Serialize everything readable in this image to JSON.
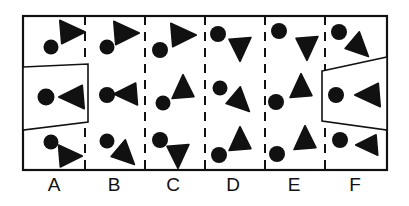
{
  "figure": {
    "title": "",
    "frame": {
      "x": 23,
      "y": 16,
      "width": 364,
      "height": 154,
      "stroke_color": "#111111",
      "stroke_width": 2.2,
      "fill_color": "#ffffff"
    },
    "dividers": {
      "style": "dashed",
      "stroke_color": "#111111",
      "stroke_width": 2.0,
      "dash_pattern": "9 7",
      "x_positions": [
        85,
        145,
        205,
        265,
        325
      ]
    },
    "columns": [
      {
        "id": "A",
        "label": "A",
        "label_x": 54,
        "label_y": 175,
        "x_start": 23,
        "x_end": 85,
        "shapes": [
          {
            "kind": "circle",
            "cx": 51,
            "cy": 47,
            "r": 7.5,
            "color": "#111111"
          },
          {
            "kind": "triangle",
            "cx": 71,
            "cy": 32,
            "size": 15,
            "rotation": 20,
            "direction": "right",
            "color": "#111111"
          },
          {
            "kind": "circle",
            "cx": 46,
            "cy": 97,
            "r": 8.5,
            "color": "#111111"
          },
          {
            "kind": "triangle",
            "cx": 73,
            "cy": 97,
            "size": 15,
            "rotation": 0,
            "direction": "left",
            "color": "#111111"
          },
          {
            "kind": "circle",
            "cx": 51,
            "cy": 142,
            "r": 7.5,
            "color": "#111111"
          },
          {
            "kind": "triangle",
            "cx": 69,
            "cy": 156,
            "size": 14,
            "rotation": 20,
            "direction": "right",
            "color": "#111111"
          }
        ]
      },
      {
        "id": "B",
        "label": "B",
        "label_x": 114,
        "label_y": 175,
        "x_start": 85,
        "x_end": 145,
        "shapes": [
          {
            "kind": "circle",
            "cx": 107,
            "cy": 47,
            "r": 7.5,
            "color": "#111111"
          },
          {
            "kind": "triangle",
            "cx": 125,
            "cy": 33,
            "size": 15,
            "rotation": 20,
            "direction": "right",
            "color": "#111111"
          },
          {
            "kind": "circle",
            "cx": 107,
            "cy": 95,
            "r": 8.0,
            "color": "#111111"
          },
          {
            "kind": "triangle",
            "cx": 127,
            "cy": 94,
            "size": 14,
            "rotation": 0,
            "direction": "left",
            "color": "#111111"
          },
          {
            "kind": "circle",
            "cx": 107,
            "cy": 141,
            "r": 7.5,
            "color": "#111111"
          },
          {
            "kind": "triangle",
            "cx": 125,
            "cy": 155,
            "size": 14,
            "rotation": 200,
            "direction": "down-right",
            "color": "#111111"
          }
        ]
      },
      {
        "id": "C",
        "label": "C",
        "label_x": 173,
        "label_y": 175,
        "x_start": 145,
        "x_end": 205,
        "shapes": [
          {
            "kind": "circle",
            "cx": 160,
            "cy": 50,
            "r": 8.0,
            "color": "#111111"
          },
          {
            "kind": "triangle",
            "cx": 182,
            "cy": 35,
            "size": 15,
            "rotation": 20,
            "direction": "right",
            "color": "#111111"
          },
          {
            "kind": "circle",
            "cx": 163,
            "cy": 103,
            "r": 7.5,
            "color": "#111111"
          },
          {
            "kind": "triangle",
            "cx": 183,
            "cy": 88,
            "size": 14,
            "rotation": 15,
            "direction": "up",
            "color": "#111111"
          },
          {
            "kind": "circle",
            "cx": 160,
            "cy": 140,
            "r": 8.0,
            "color": "#111111"
          },
          {
            "kind": "triangle",
            "cx": 178,
            "cy": 155,
            "size": 14,
            "rotation": 190,
            "direction": "down",
            "color": "#111111"
          }
        ]
      },
      {
        "id": "D",
        "label": "D",
        "label_x": 233,
        "label_y": 175,
        "x_start": 205,
        "x_end": 265,
        "shapes": [
          {
            "kind": "circle",
            "cx": 218,
            "cy": 34,
            "r": 8.0,
            "color": "#111111"
          },
          {
            "kind": "triangle",
            "cx": 240,
            "cy": 48,
            "size": 14,
            "rotation": 185,
            "direction": "down",
            "color": "#111111"
          },
          {
            "kind": "circle",
            "cx": 220,
            "cy": 88,
            "r": 7.5,
            "color": "#111111"
          },
          {
            "kind": "triangle",
            "cx": 240,
            "cy": 102,
            "size": 14,
            "rotation": 160,
            "direction": "down-right",
            "color": "#111111"
          },
          {
            "kind": "circle",
            "cx": 219,
            "cy": 155,
            "r": 8.0,
            "color": "#111111"
          },
          {
            "kind": "triangle",
            "cx": 240,
            "cy": 140,
            "size": 14,
            "rotation": 10,
            "direction": "up",
            "color": "#111111"
          }
        ]
      },
      {
        "id": "E",
        "label": "E",
        "label_x": 294,
        "label_y": 175,
        "x_start": 265,
        "x_end": 325,
        "shapes": [
          {
            "kind": "circle",
            "cx": 279,
            "cy": 31,
            "r": 8.0,
            "color": "#111111"
          },
          {
            "kind": "triangle",
            "cx": 307,
            "cy": 47,
            "size": 14,
            "rotation": 195,
            "direction": "down",
            "color": "#111111"
          },
          {
            "kind": "circle",
            "cx": 276,
            "cy": 102,
            "r": 8.0,
            "color": "#111111"
          },
          {
            "kind": "triangle",
            "cx": 301,
            "cy": 87,
            "size": 14,
            "rotation": 10,
            "direction": "up",
            "color": "#111111"
          },
          {
            "kind": "circle",
            "cx": 277,
            "cy": 154,
            "r": 8.0,
            "color": "#111111"
          },
          {
            "kind": "triangle",
            "cx": 305,
            "cy": 139,
            "size": 14,
            "rotation": 10,
            "direction": "up",
            "color": "#111111"
          }
        ]
      },
      {
        "id": "F",
        "label": "F",
        "label_x": 355,
        "label_y": 175,
        "x_start": 325,
        "x_end": 387,
        "shapes": [
          {
            "kind": "circle",
            "cx": 339,
            "cy": 32,
            "r": 8.0,
            "color": "#111111"
          },
          {
            "kind": "triangle",
            "cx": 359,
            "cy": 47,
            "size": 14,
            "rotation": 200,
            "direction": "down-right",
            "color": "#111111"
          },
          {
            "kind": "circle",
            "cx": 336,
            "cy": 95,
            "r": 8.0,
            "color": "#111111"
          },
          {
            "kind": "triangle",
            "cx": 369,
            "cy": 95,
            "size": 15,
            "rotation": 0,
            "direction": "left",
            "color": "#111111"
          },
          {
            "kind": "circle",
            "cx": 340,
            "cy": 140,
            "r": 8.0,
            "color": "#111111"
          },
          {
            "kind": "triangle",
            "cx": 368,
            "cy": 145,
            "size": 13,
            "rotation": 0,
            "direction": "left",
            "color": "#111111"
          }
        ]
      }
    ],
    "overlays": [
      {
        "id": "left-trapezoid",
        "name": "left-trapezoid",
        "points": "23,67 88,64 88,122 23,130",
        "stroke_color": "#111111",
        "stroke_width": 1.6,
        "fill_color": "#ffffff"
      },
      {
        "id": "right-trapezoid",
        "name": "right-trapezoid",
        "points": "322,71 387,57 387,130 322,121",
        "stroke_color": "#111111",
        "stroke_width": 1.6,
        "fill_color": "#ffffff"
      }
    ],
    "label_row": {
      "labels": [
        "A",
        "B",
        "C",
        "D",
        "E",
        "F"
      ],
      "font_size": 19,
      "color": "#111111"
    }
  }
}
